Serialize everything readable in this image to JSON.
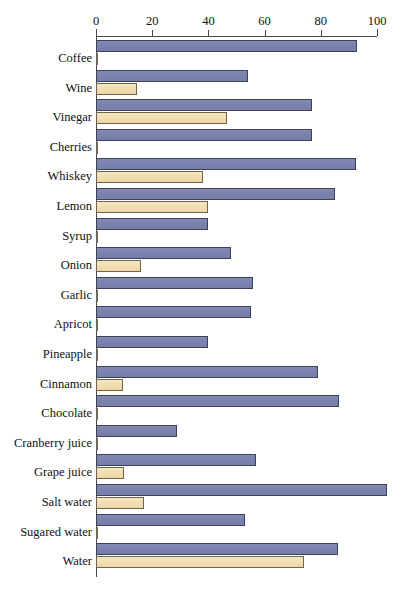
{
  "chart": {
    "type": "bar",
    "orientation": "horizontal",
    "title": "",
    "xlabel": "",
    "ylabel": ""
  },
  "axis": {
    "ticks": [
      {
        "label": "0",
        "value": 0
      },
      {
        "label": "20",
        "value": 20
      },
      {
        "label": "40",
        "value": 40
      },
      {
        "label": "60",
        "value": 60
      },
      {
        "label": "80",
        "value": 80
      },
      {
        "label": "100",
        "value": 100
      }
    ],
    "min": 0,
    "max": 100,
    "position": "top",
    "grid": false
  },
  "colors": {
    "series_1": "#7a81ad",
    "series_2": "#f2ddb0",
    "axis": "#4a4a4a",
    "bar_outline": "#3d4257",
    "background": "#ffffff"
  },
  "chart_data": {
    "type": "bar",
    "orientation": "horizontal",
    "title": "",
    "xlabel": "",
    "ylabel": "",
    "xlim": [
      0,
      100
    ],
    "grid": false,
    "legend": "none",
    "categories": [
      "Coffee",
      "Wine",
      "Vinegar",
      "Cherries",
      "Whiskey",
      "Lemon",
      "Syrup",
      "Onion",
      "Garlic",
      "Apricot",
      "Pineapple",
      "Cinnamon",
      "Chocolate",
      "Cranberry juice",
      "Grape juice",
      "Salt water",
      "Sugared water",
      "Water"
    ],
    "series": [
      {
        "name": "series-1",
        "color": "#7a81ad",
        "values": [
          93,
          54,
          77,
          77,
          92.5,
          85,
          40,
          48,
          56,
          55,
          40,
          79,
          86.5,
          29,
          57,
          103.5,
          53,
          86
        ]
      },
      {
        "name": "series-2",
        "color": "#f2ddb0",
        "values": [
          0.8,
          14.5,
          46.5,
          0.8,
          38,
          40,
          0.8,
          16,
          0.8,
          0.8,
          0.8,
          9.5,
          0.8,
          0.8,
          10,
          17,
          0.8,
          74
        ]
      }
    ]
  }
}
